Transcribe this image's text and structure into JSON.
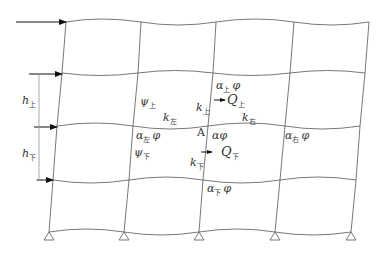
{
  "diagram": {
    "bays": 4,
    "stories": 4,
    "joint_label": "A",
    "story_heights": [
      {
        "symbol": "h",
        "sub": "上"
      },
      {
        "symbol": "h",
        "sub": "下"
      }
    ],
    "labels": {
      "alpha_top": {
        "main": "α",
        "sub": "上",
        "tail": "φ"
      },
      "psi_top": {
        "main": "ψ",
        "sub": "上"
      },
      "k_top": {
        "main": "k",
        "sub": "上"
      },
      "Q_top": {
        "main": "Q",
        "sub": "上"
      },
      "k_left": {
        "main": "k",
        "sub": "左"
      },
      "k_right": {
        "main": "k",
        "sub": "右"
      },
      "alpha_left": {
        "main": "α",
        "sub": "左",
        "tail": "φ"
      },
      "alpha_center": {
        "main": "αφ"
      },
      "alpha_right": {
        "main": "α",
        "sub": "右",
        "tail": "φ"
      },
      "psi_bottom": {
        "main": "ψ",
        "sub": "下"
      },
      "k_bottom": {
        "main": "k",
        "sub": "下"
      },
      "Q_bottom": {
        "main": "Q",
        "sub": "下"
      },
      "alpha_bottom": {
        "main": "α",
        "sub": "下",
        "tail": "φ"
      }
    },
    "lateral_loads": 4,
    "supports": 5,
    "support_type": "pinned"
  }
}
